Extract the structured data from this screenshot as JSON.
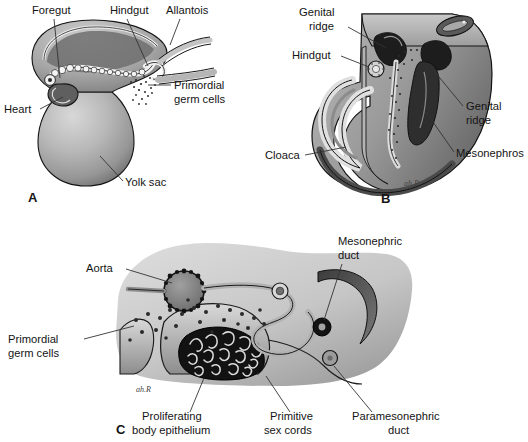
{
  "figure": {
    "background_color": "#ffffff",
    "ink_color": "#141414"
  },
  "panels": [
    {
      "id": "A",
      "letter": "A",
      "caption": "Embryo with yolk sac showing migration of primordial germ cells",
      "labels": [
        {
          "name": "foregut",
          "text": "Foregut"
        },
        {
          "name": "hindgut",
          "text": "Hindgut"
        },
        {
          "name": "allantois",
          "text": "Allantois"
        },
        {
          "name": "primordial-germ-cells",
          "text_line1": "Primordial",
          "text_line2": "germ cells"
        },
        {
          "name": "heart",
          "text": "Heart"
        },
        {
          "name": "yolk-sac",
          "text": "Yolk sac"
        }
      ]
    },
    {
      "id": "B",
      "letter": "B",
      "caption": "Cutaway of caudal embryo showing genital ridges and mesonephros",
      "signature": "ah.R",
      "labels": [
        {
          "name": "genital-ridge-left",
          "text_line1": "Genital",
          "text_line2": "ridge"
        },
        {
          "name": "hindgut",
          "text": "Hindgut"
        },
        {
          "name": "cloaca",
          "text": "Cloaca"
        },
        {
          "name": "genital-ridge-right",
          "text_line1": "Genital",
          "text_line2": "ridge"
        },
        {
          "name": "mesonephros",
          "text": "Mesonephros"
        }
      ]
    },
    {
      "id": "C",
      "letter": "C",
      "caption": "Transverse section through genital ridge showing primitive sex cords",
      "signature": "ah.R",
      "labels": [
        {
          "name": "aorta",
          "text": "Aorta"
        },
        {
          "name": "primordial-germ-cells",
          "text_line1": "Primordial",
          "text_line2": "germ cells"
        },
        {
          "name": "mesonephric-duct",
          "text_line1": "Mesonephric",
          "text_line2": "duct"
        },
        {
          "name": "proliferating-body-epithelium",
          "text_line1": "Proliferating",
          "text_line2": "body epithelium"
        },
        {
          "name": "primitive-sex-cords",
          "text_line1": "Primitive",
          "text_line2": "sex cords"
        },
        {
          "name": "paramesonephric-duct",
          "text_line1": "Paramesonephric",
          "text_line2": "duct"
        }
      ]
    }
  ],
  "palette": {
    "white": "#ffffff",
    "pale_gray": "#e2e2e2",
    "light_gray": "#cfcfcf",
    "mid_gray": "#a9a9a9",
    "gray": "#8e8e8e",
    "dark_gray": "#5c5c5c",
    "darker_gray": "#3a3a3a",
    "near_black": "#1b1b1b",
    "outline": "#141414"
  }
}
